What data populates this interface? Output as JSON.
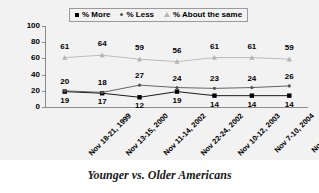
{
  "caption": "Younger vs. Older Americans",
  "legend": {
    "position": "top-center",
    "items": [
      {
        "label": "% More",
        "marker": "square-marker",
        "color": "#000000"
      },
      {
        "label": "% Less",
        "marker": "dot-marker",
        "color": "#555555"
      },
      {
        "label": "% About the same",
        "marker": "triangle-marker",
        "color": "#b5b5b5"
      }
    ]
  },
  "chart_data": {
    "type": "line",
    "title": "",
    "subtitle": "",
    "xlabel": "",
    "ylabel": "",
    "ylim": [
      0,
      100
    ],
    "yticks": [
      0,
      20,
      40,
      60,
      80,
      100
    ],
    "grid": false,
    "legend_position": "top-center",
    "categories": [
      "Nov 18-21, 1999",
      "Nov 13-15, 2000",
      "Nov 11-14, 2002",
      "Nov 22-24, 2002",
      "Nov 10-12, 2003",
      "Nov 7-10, 2004",
      "Nov 7-10, 2005"
    ],
    "series": [
      {
        "name": "% More",
        "marker": "square-marker",
        "color": "#000000",
        "values": [
          19,
          17,
          12,
          19,
          14,
          14,
          14
        ]
      },
      {
        "name": "% Less",
        "marker": "dot-marker",
        "color": "#555555",
        "values": [
          20,
          18,
          27,
          24,
          23,
          24,
          26
        ]
      },
      {
        "name": "% About the same",
        "marker": "triangle-marker",
        "color": "#b5b5b5",
        "values": [
          61,
          64,
          59,
          56,
          61,
          61,
          59
        ]
      }
    ]
  }
}
